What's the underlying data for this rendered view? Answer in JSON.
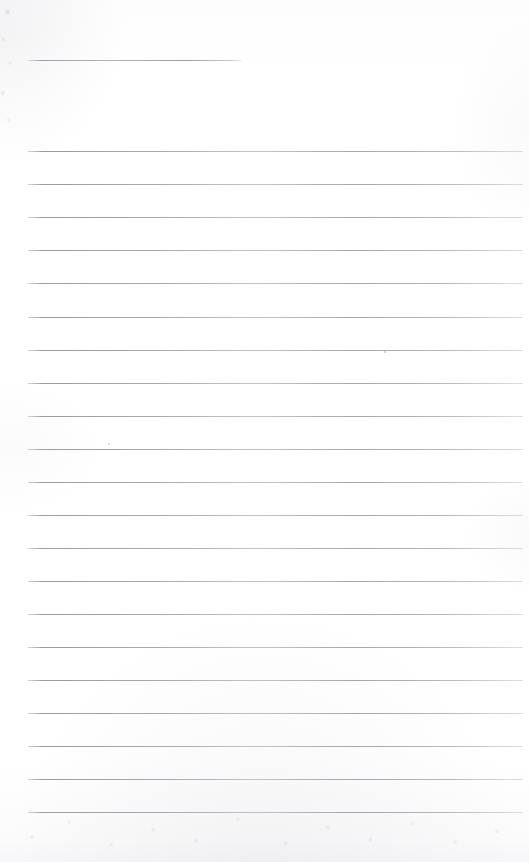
{
  "document": {
    "kind": "scanned-blank-lined-page",
    "title": "",
    "body_text": "",
    "page_width": 529,
    "page_height": 862,
    "background_color": "#fefeff",
    "rule_color": "#9c9ca6",
    "rule_thickness_px": 1,
    "rule_left_x": 28,
    "rule_right_x": 523,
    "rule_spacing_px": 33,
    "header_rule": {
      "label": "header-short-rule",
      "x_start": 28,
      "x_end": 242,
      "y": 60
    },
    "body_rules": [
      {
        "label": "rule-1",
        "y": 151
      },
      {
        "label": "rule-2",
        "y": 184
      },
      {
        "label": "rule-3",
        "y": 217
      },
      {
        "label": "rule-4",
        "y": 250
      },
      {
        "label": "rule-5",
        "y": 283
      },
      {
        "label": "rule-6",
        "y": 317
      },
      {
        "label": "rule-7",
        "y": 350
      },
      {
        "label": "rule-8",
        "y": 383
      },
      {
        "label": "rule-9",
        "y": 416
      },
      {
        "label": "rule-10",
        "y": 449
      },
      {
        "label": "rule-11",
        "y": 482
      },
      {
        "label": "rule-12",
        "y": 515
      },
      {
        "label": "rule-13",
        "y": 548
      },
      {
        "label": "rule-14",
        "y": 581
      },
      {
        "label": "rule-15",
        "y": 614
      },
      {
        "label": "rule-16",
        "y": 647
      },
      {
        "label": "rule-17",
        "y": 680
      },
      {
        "label": "rule-18",
        "y": 713
      },
      {
        "label": "rule-19",
        "y": 746
      },
      {
        "label": "rule-20",
        "y": 779
      },
      {
        "label": "rule-21",
        "y": 812
      }
    ],
    "marks": [
      {
        "label": "ink-speck-upper-right",
        "x": 384,
        "y": 351,
        "size": 2,
        "color": "#c8a8ac"
      },
      {
        "label": "ink-speck-left-mid",
        "x": 108,
        "y": 443,
        "size": 2,
        "color": "#c0c0c8"
      }
    ]
  }
}
